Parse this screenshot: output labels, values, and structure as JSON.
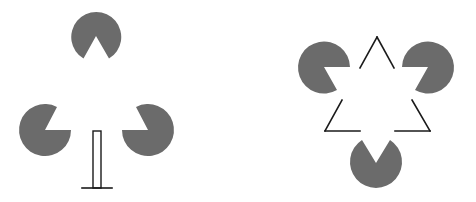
{
  "figure": {
    "colors": {
      "pacman": "#6b6b6b",
      "line": "#1a1a1a",
      "background": "#ffffff"
    },
    "left_panel": {
      "label": "illusory triangle with post",
      "pacmen": [
        {
          "id": "top",
          "cx": 96,
          "cy": 35,
          "r": 25,
          "mouth": "down"
        },
        {
          "id": "left",
          "cx": 45,
          "cy": 130,
          "r": 26,
          "mouth": "upper-right"
        },
        {
          "id": "right",
          "cx": 148,
          "cy": 130,
          "r": 26,
          "mouth": "upper-left"
        }
      ],
      "post": {
        "x": 93,
        "y": 131,
        "width": 8,
        "height": 57
      },
      "base_line": {
        "x1": 82,
        "y1": 188,
        "x2": 112,
        "y2": 188
      }
    },
    "right_panel": {
      "label": "Kanizsa triangle",
      "pacmen": [
        {
          "id": "left",
          "cx": 324,
          "cy": 67,
          "r": 26,
          "mouth": "lower-right"
        },
        {
          "id": "right",
          "cx": 428,
          "cy": 67,
          "r": 26,
          "mouth": "lower-left"
        },
        {
          "id": "bottom",
          "cx": 376,
          "cy": 163,
          "r": 26,
          "mouth": "up"
        }
      ],
      "outline_triangle": {
        "apex": [
          377,
          36
        ],
        "bottom_left": [
          325,
          131
        ],
        "bottom_right": [
          430,
          131
        ]
      }
    }
  }
}
